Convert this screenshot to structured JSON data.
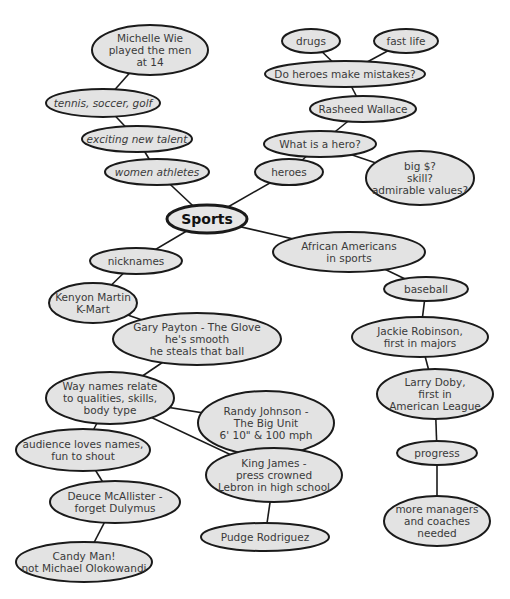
{
  "diagram": {
    "type": "mind-map",
    "colors": {
      "node_fill": "#e3e3e3",
      "node_stroke": "#1a1a1a",
      "text": "#3a3a3a",
      "background": "#ffffff"
    },
    "central": {
      "id": "sports",
      "label": "Sports"
    },
    "nodes": [
      {
        "id": "sports",
        "lines": [
          "Sports"
        ]
      },
      {
        "id": "michelle",
        "lines": [
          "Michelle Wie",
          "played the men",
          "at 14"
        ]
      },
      {
        "id": "tennis",
        "lines": [
          "tennis, soccer, golf"
        ]
      },
      {
        "id": "exciting",
        "lines": [
          "exciting new talent"
        ]
      },
      {
        "id": "women",
        "lines": [
          "women athletes"
        ]
      },
      {
        "id": "drugs",
        "lines": [
          "drugs"
        ]
      },
      {
        "id": "fastlife",
        "lines": [
          "fast life"
        ]
      },
      {
        "id": "mistakes",
        "lines": [
          "Do heroes make mistakes?"
        ]
      },
      {
        "id": "rasheed",
        "lines": [
          "Rasheed Wallace"
        ]
      },
      {
        "id": "whathero",
        "lines": [
          "What is a hero?"
        ]
      },
      {
        "id": "heroes",
        "lines": [
          "heroes"
        ]
      },
      {
        "id": "bigmoney",
        "lines": [
          "big $?",
          "skill?",
          "admirable values?"
        ]
      },
      {
        "id": "african",
        "lines": [
          "African Americans",
          "in sports"
        ]
      },
      {
        "id": "baseball",
        "lines": [
          "baseball"
        ]
      },
      {
        "id": "jackie",
        "lines": [
          "Jackie Robinson,",
          "first in majors"
        ]
      },
      {
        "id": "larry",
        "lines": [
          "Larry Doby,",
          "first in",
          "American League"
        ]
      },
      {
        "id": "progress",
        "lines": [
          "progress"
        ]
      },
      {
        "id": "managers",
        "lines": [
          "more managers",
          "and coaches",
          "needed"
        ]
      },
      {
        "id": "nicknames",
        "lines": [
          "nicknames"
        ]
      },
      {
        "id": "kenyon",
        "lines": [
          "Kenyon Martin",
          "K-Mart"
        ]
      },
      {
        "id": "gary",
        "lines": [
          "Gary Payton - The Glove",
          "he's smooth",
          "he steals that ball"
        ]
      },
      {
        "id": "waynames",
        "lines": [
          "Way names relate",
          "to qualities, skills,",
          "body type"
        ]
      },
      {
        "id": "randy",
        "lines": [
          "Randy Johnson -",
          "The Big Unit",
          "6' 10\" & 100 mph"
        ]
      },
      {
        "id": "audience",
        "lines": [
          "audience loves names,",
          "fun to shout"
        ]
      },
      {
        "id": "king",
        "lines": [
          "King James -",
          "press crowned",
          "Lebron in high school"
        ]
      },
      {
        "id": "deuce",
        "lines": [
          "Deuce McAllister -",
          "forget Dulymus"
        ]
      },
      {
        "id": "pudge",
        "lines": [
          "Pudge Rodriguez"
        ]
      },
      {
        "id": "candy",
        "lines": [
          "Candy Man!",
          "not Michael Olokowandi"
        ]
      }
    ],
    "edges": [
      [
        "michelle",
        "tennis"
      ],
      [
        "tennis",
        "exciting"
      ],
      [
        "exciting",
        "women"
      ],
      [
        "women",
        "sports"
      ],
      [
        "drugs",
        "mistakes"
      ],
      [
        "fastlife",
        "mistakes"
      ],
      [
        "mistakes",
        "rasheed"
      ],
      [
        "rasheed",
        "whathero"
      ],
      [
        "whathero",
        "heroes"
      ],
      [
        "whathero",
        "bigmoney"
      ],
      [
        "heroes",
        "sports"
      ],
      [
        "sports",
        "african"
      ],
      [
        "african",
        "baseball"
      ],
      [
        "baseball",
        "jackie"
      ],
      [
        "jackie",
        "larry"
      ],
      [
        "larry",
        "progress"
      ],
      [
        "progress",
        "managers"
      ],
      [
        "sports",
        "nicknames"
      ],
      [
        "nicknames",
        "kenyon"
      ],
      [
        "kenyon",
        "gary"
      ],
      [
        "gary",
        "waynames"
      ],
      [
        "waynames",
        "randy"
      ],
      [
        "waynames",
        "king"
      ],
      [
        "waynames",
        "audience"
      ],
      [
        "audience",
        "deuce"
      ],
      [
        "deuce",
        "candy"
      ],
      [
        "king",
        "pudge"
      ]
    ]
  }
}
